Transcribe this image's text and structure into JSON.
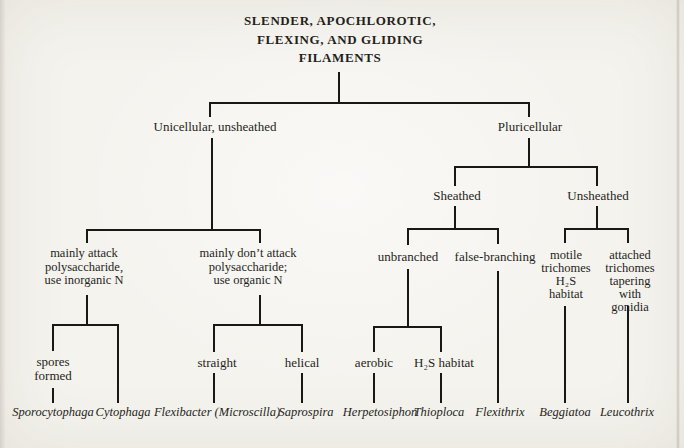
{
  "theme": {
    "page-bg": "#f5f3ee",
    "ink": "#241f1b",
    "line": "#1a1714"
  },
  "tree": {
    "root_label": "SLENDER, APOCHLOROTIC,\nFLEXING, AND GLIDING\nFILAMENTS",
    "unicellular": {
      "label": "Unicellular, unsheathed",
      "mainly_attack": {
        "label": "mainly attack\npolysaccharide,\nuse inorganic N",
        "spores_formed": {
          "label": "spores\nformed",
          "genus": "Sporocytophaga"
        },
        "no_spores": {
          "genus": "Cytophaga"
        }
      },
      "mainly_dont_attack": {
        "label": "mainly don’t attack\npolysaccharide;\nuse organic N",
        "straight": {
          "label": "straight",
          "genus": "Flexibacter (Microscilla)"
        },
        "helical": {
          "label": "helical",
          "genus": "Saprospira"
        }
      }
    },
    "pluricellular": {
      "label": "Pluricellular",
      "sheathed": {
        "label": "Sheathed",
        "unbranched": {
          "label": "unbranched",
          "aerobic": {
            "label": "aerobic",
            "genus": "Herpetosiphon"
          },
          "h2s_habitat": {
            "label": "H₂S habitat",
            "genus": "Thioploca"
          }
        },
        "false_branching": {
          "label": "false-branching",
          "genus": "Flexithrix"
        }
      },
      "unsheathed": {
        "label": "Unsheathed",
        "motile_trichomes": {
          "label": "motile\ntrichomes\nH₂S\nhabitat",
          "genus": "Beggiatoa"
        },
        "attached_trichomes": {
          "label": "attached\ntrichomes\ntapering\nwith gonidia",
          "genus": "Leucothrix"
        }
      }
    }
  }
}
